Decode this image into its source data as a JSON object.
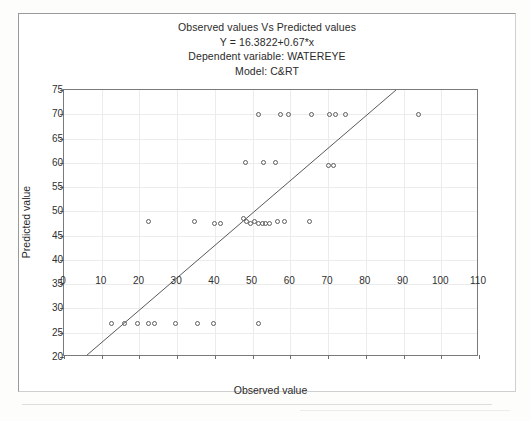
{
  "figure": {
    "title_lines": [
      "Observed values Vs Predicted values",
      "Y = 16.3822+0.67*x",
      "Dependent variable: WATEREYE",
      "Model: C&RT"
    ]
  },
  "chart_data": {
    "type": "scatter",
    "title": "Observed values Vs Predicted values",
    "subtitle": "Y = 16.3822+0.67*x",
    "dependent_variable": "WATEREYE",
    "model": "C&RT",
    "xlabel": "Observed value",
    "ylabel": "Predicted value",
    "xlim": [
      0,
      110
    ],
    "ylim": [
      20,
      75
    ],
    "xticks": [
      0,
      10,
      20,
      30,
      40,
      50,
      60,
      70,
      80,
      90,
      100,
      110
    ],
    "yticks": [
      20,
      25,
      30,
      35,
      40,
      45,
      50,
      55,
      60,
      65,
      70,
      75
    ],
    "grid": true,
    "legend": null,
    "marker": "open-circle",
    "fit_line": {
      "intercept": 16.3822,
      "slope": 0.67,
      "equation": "Y = 16.3822+0.67*x",
      "x_start": 5.5,
      "x_end": 88.0,
      "y_start": 20.0,
      "y_end": 75.0
    },
    "points": [
      {
        "x": 12.5,
        "y": 27
      },
      {
        "x": 16.0,
        "y": 27
      },
      {
        "x": 19.5,
        "y": 27
      },
      {
        "x": 22.5,
        "y": 27
      },
      {
        "x": 24.0,
        "y": 27
      },
      {
        "x": 29.5,
        "y": 27
      },
      {
        "x": 35.5,
        "y": 27
      },
      {
        "x": 39.5,
        "y": 27
      },
      {
        "x": 51.5,
        "y": 27
      },
      {
        "x": 22.5,
        "y": 48
      },
      {
        "x": 34.5,
        "y": 48
      },
      {
        "x": 40.0,
        "y": 47.5
      },
      {
        "x": 41.5,
        "y": 47.5
      },
      {
        "x": 47.5,
        "y": 48.5
      },
      {
        "x": 48.5,
        "y": 48
      },
      {
        "x": 49.5,
        "y": 47.5
      },
      {
        "x": 50.5,
        "y": 48
      },
      {
        "x": 51.5,
        "y": 47.5
      },
      {
        "x": 52.5,
        "y": 47.5
      },
      {
        "x": 53.5,
        "y": 47.5
      },
      {
        "x": 54.5,
        "y": 47.5
      },
      {
        "x": 56.5,
        "y": 48
      },
      {
        "x": 58.5,
        "y": 48
      },
      {
        "x": 65.0,
        "y": 48
      },
      {
        "x": 48.0,
        "y": 60
      },
      {
        "x": 53.0,
        "y": 60
      },
      {
        "x": 56.0,
        "y": 60
      },
      {
        "x": 70.0,
        "y": 59.5
      },
      {
        "x": 71.5,
        "y": 59.5
      },
      {
        "x": 51.5,
        "y": 70
      },
      {
        "x": 57.5,
        "y": 70
      },
      {
        "x": 59.5,
        "y": 70
      },
      {
        "x": 65.5,
        "y": 70
      },
      {
        "x": 70.5,
        "y": 70
      },
      {
        "x": 72.0,
        "y": 70
      },
      {
        "x": 74.5,
        "y": 70
      },
      {
        "x": 94.0,
        "y": 70
      }
    ]
  }
}
